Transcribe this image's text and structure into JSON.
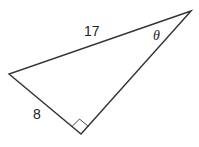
{
  "diagram": {
    "type": "right-triangle",
    "vertices": {
      "top_right": [
        191,
        11
      ],
      "left": [
        9,
        74
      ],
      "right_angle": [
        81,
        134
      ]
    },
    "labels": {
      "hypotenuse": "17",
      "leg": "8",
      "angle": "θ"
    },
    "colors": {
      "stroke": "#333333",
      "text": "#222222",
      "background": "#ffffff"
    }
  }
}
